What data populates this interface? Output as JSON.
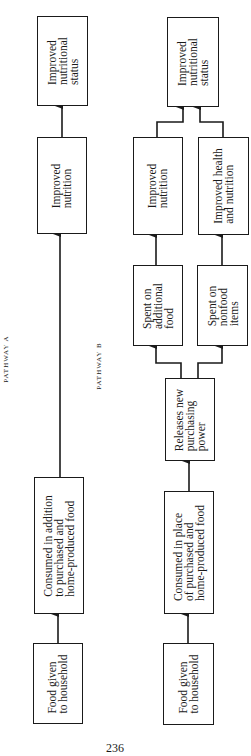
{
  "diagram": {
    "pathway_a": {
      "label": "PATHWAY A",
      "nodes": [
        {
          "id": "a_food_given",
          "text": "Food given\nto household"
        },
        {
          "id": "a_consumed_addition",
          "text": "Consumed in addition\nto purchased and\nhome-produced food"
        },
        {
          "id": "a_improved_nutrition",
          "text": "Improved\nnutrition"
        },
        {
          "id": "a_improved_status",
          "text": "Improved\nnutritional\nstatus"
        }
      ],
      "edges": [
        [
          "a_food_given",
          "a_consumed_addition"
        ],
        [
          "a_consumed_addition",
          "a_improved_nutrition"
        ],
        [
          "a_improved_nutrition",
          "a_improved_status"
        ]
      ]
    },
    "pathway_b": {
      "label": "PATHWAY B",
      "nodes": [
        {
          "id": "b_food_given",
          "text": "Food given\nto household"
        },
        {
          "id": "b_consumed_place",
          "text": "Consumed in place\nof purchased and\nhome-produced food"
        },
        {
          "id": "b_releases_power",
          "text": "Releases new\npurchasing\npower"
        },
        {
          "id": "b_spent_food",
          "text": "Spent on\nadditional\nfood"
        },
        {
          "id": "b_spent_nonfood",
          "text": "Spent on\nnonfood\nitems"
        },
        {
          "id": "b_improved_nutrition",
          "text": "Improved\nnutrition"
        },
        {
          "id": "b_improved_health",
          "text": "Improved health\nand nutrition"
        },
        {
          "id": "b_improved_status",
          "text": "Improved\nnutritional\nstatus"
        }
      ],
      "edges": [
        [
          "b_food_given",
          "b_consumed_place"
        ],
        [
          "b_consumed_place",
          "b_releases_power"
        ],
        [
          "b_releases_power",
          "b_spent_food"
        ],
        [
          "b_releases_power",
          "b_spent_nonfood"
        ],
        [
          "b_spent_food",
          "b_improved_nutrition"
        ],
        [
          "b_spent_nonfood",
          "b_improved_health"
        ],
        [
          "b_improved_nutrition",
          "b_improved_status"
        ],
        [
          "b_improved_health",
          "b_improved_status"
        ]
      ]
    },
    "page_number": "236"
  }
}
